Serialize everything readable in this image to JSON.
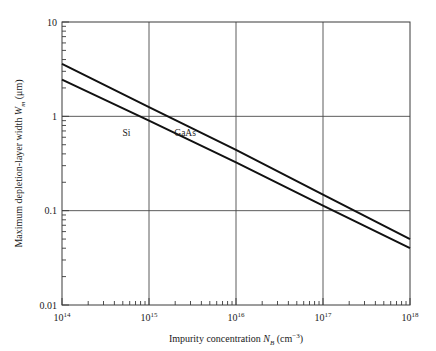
{
  "chart_data": {
    "type": "line",
    "title": "",
    "xlabel_parts": {
      "text": "Impurity concentration ",
      "symbol": "N",
      "subscript": "B",
      "units_open": " (cm",
      "units_exp": "−3",
      "units_close": ")"
    },
    "ylabel_parts": {
      "text": "Maximum depletion-layer width ",
      "symbol": "W",
      "subscript": "m",
      "units": " (μm)"
    },
    "xlabel": "Impurity concentration N_B (cm^-3)",
    "ylabel": "Maximum depletion-layer width W_m (μm)",
    "xscale": "log",
    "yscale": "log",
    "xlim": [
      100000000000000.0,
      1e+18
    ],
    "ylim": [
      0.01,
      10
    ],
    "grid": true,
    "grid_note": "major decade gridlines at 1e15, 1e16, 1e17 (vertical) and 1, 0.1 (horizontal)",
    "legend_position": "inline-annotation",
    "xticks": [
      {
        "value": 100000000000000.0,
        "mantissa": "10",
        "exponent": "14"
      },
      {
        "value": 1000000000000000.0,
        "mantissa": "10",
        "exponent": "15"
      },
      {
        "value": 1e+16,
        "mantissa": "10",
        "exponent": "16"
      },
      {
        "value": 1e+17,
        "mantissa": "10",
        "exponent": "17"
      },
      {
        "value": 1e+18,
        "mantissa": "10",
        "exponent": "18"
      }
    ],
    "yticks": [
      {
        "value": 10,
        "label": "10"
      },
      {
        "value": 1,
        "label": "1"
      },
      {
        "value": 0.1,
        "label": "0.1"
      },
      {
        "value": 0.01,
        "label": "0.01"
      }
    ],
    "series": [
      {
        "name": "GaAs",
        "label": "GaAs",
        "annotation_x": 2600000000000000.0,
        "annotation_y": 0.62,
        "points": [
          {
            "x": 100000000000000.0,
            "y": 3.6
          },
          {
            "x": 1000000000000000.0,
            "y": 1.25
          },
          {
            "x": 1e+16,
            "y": 0.44
          },
          {
            "x": 1e+17,
            "y": 0.148
          },
          {
            "x": 1e+18,
            "y": 0.05
          }
        ]
      },
      {
        "name": "Si",
        "label": "Si",
        "annotation_x": 550000000000000.0,
        "annotation_y": 0.62,
        "points": [
          {
            "x": 100000000000000.0,
            "y": 2.45
          },
          {
            "x": 1000000000000000.0,
            "y": 0.9
          },
          {
            "x": 1e+16,
            "y": 0.325
          },
          {
            "x": 1e+17,
            "y": 0.113
          },
          {
            "x": 1e+18,
            "y": 0.04
          }
        ]
      }
    ],
    "colors": {
      "background": "#ffffff",
      "axis": "#3a3a3a",
      "grid": "#4a4a4a",
      "curve": "#111111",
      "text": "#1a1a1a"
    }
  }
}
